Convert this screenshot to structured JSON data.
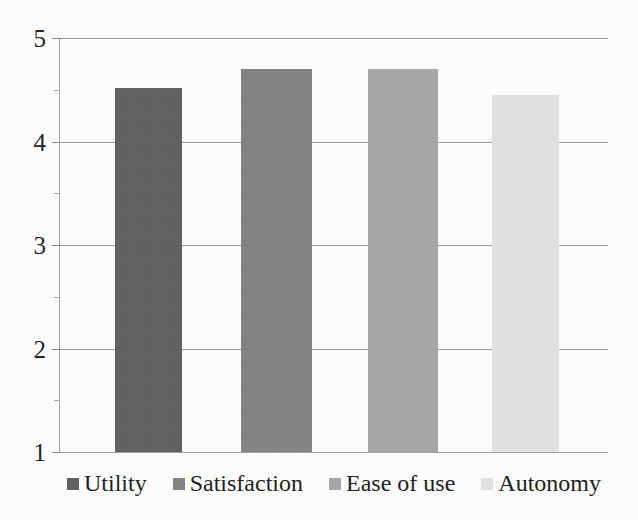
{
  "chart_data": {
    "type": "bar",
    "title": "",
    "subtitle": "",
    "xlabel": "",
    "ylabel": "",
    "categories": [
      "Utility",
      "Satisfaction",
      "Ease of use",
      "Autonomy"
    ],
    "values": [
      4.52,
      4.7,
      4.7,
      4.45
    ],
    "series": [
      {
        "name": "Mean rating",
        "values": [
          4.52,
          4.7,
          4.7,
          4.45
        ]
      }
    ],
    "colors": [
      "#636363",
      "#858585",
      "#a8a8a8",
      "#e2e2e2"
    ],
    "ylim": [
      1,
      5
    ],
    "y_ticks": [
      "1",
      "2",
      "3",
      "4",
      "5"
    ],
    "y_tick_values": [
      1,
      2,
      3,
      4,
      5
    ],
    "y_minor_tick_values": [
      1.5,
      2.5,
      3.5,
      4.5
    ],
    "x_ticks": [],
    "grid": true,
    "grid_axis": "y",
    "legend": true,
    "legend_position": "bottom",
    "legend_entries": [
      {
        "label": "Utility",
        "color": "#636363"
      },
      {
        "label": "Satisfaction",
        "color": "#858585"
      },
      {
        "label": "Ease of use",
        "color": "#a8a8a8"
      },
      {
        "label": "Autonomy",
        "color": "#e2e2e2"
      }
    ],
    "annotations": [],
    "background_color": "#fefefe",
    "gridline_color": "#9b9b9b",
    "axis_color": "#a5a5a5",
    "text_color": "#262626"
  },
  "axis": {
    "y_label_1": "1",
    "y_label_2": "2",
    "y_label_3": "3",
    "y_label_4": "4",
    "y_label_5": "5"
  },
  "legend": {
    "item_0_label": "Utility",
    "item_1_label": "Satisfaction",
    "item_2_label": "Ease of use",
    "item_3_label": "Autonomy"
  }
}
